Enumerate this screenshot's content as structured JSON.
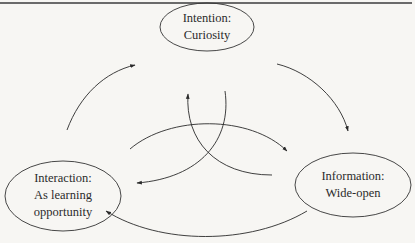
{
  "diagram": {
    "nodes": [
      {
        "id": "intention",
        "line1": "Intention:",
        "line2": "Curiosity"
      },
      {
        "id": "information",
        "line1": "Information:",
        "line2": "Wide-open"
      },
      {
        "id": "interaction",
        "line1": "Interaction:",
        "line2": "As learning",
        "line3": "opportunity"
      }
    ],
    "edges": [
      {
        "from": "interaction",
        "to": "intention",
        "type": "outer"
      },
      {
        "from": "intention",
        "to": "information",
        "type": "outer"
      },
      {
        "from": "information",
        "to": "interaction",
        "type": "outer"
      },
      {
        "from": "intention",
        "to": "interaction",
        "type": "inner"
      },
      {
        "from": "information",
        "to": "intention",
        "type": "inner"
      },
      {
        "from": "interaction",
        "to": "information",
        "type": "inner"
      }
    ],
    "colors": {
      "background": "#f7f6f3",
      "stroke": "#2a2a2a",
      "rule": "#6a6a6a"
    }
  }
}
